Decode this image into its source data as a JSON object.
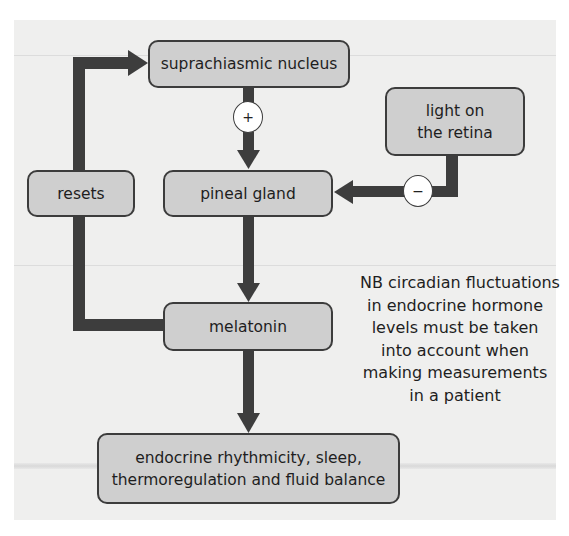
{
  "diagram": {
    "nodes": {
      "scn": {
        "label": "suprachiasmic nucleus"
      },
      "light": {
        "label_line1": "light on",
        "label_line2": "the retina"
      },
      "resets": {
        "label": "resets"
      },
      "pineal": {
        "label": "pineal gland"
      },
      "melatonin": {
        "label": "melatonin"
      },
      "effects": {
        "label_line1": "endocrine rhythmicity, sleep,",
        "label_line2": "thermoregulation and fluid balance"
      }
    },
    "edges": [
      {
        "from": "scn",
        "to": "pineal",
        "sign": "+"
      },
      {
        "from": "light",
        "to": "pineal",
        "sign": "−"
      },
      {
        "from": "pineal",
        "to": "melatonin",
        "sign": ""
      },
      {
        "from": "melatonin",
        "to": "effects",
        "sign": ""
      },
      {
        "from": "melatonin",
        "to": "resets",
        "sign": ""
      },
      {
        "from": "resets",
        "to": "scn",
        "sign": ""
      }
    ],
    "signs": {
      "plus": "+",
      "minus": "−"
    },
    "note": [
      "NB circadian fluctuations",
      "in endocrine hormone",
      "levels must be taken",
      "into account when",
      "making measurements",
      "in a patient"
    ],
    "colors": {
      "panel": "#efefee",
      "box_fill": "#cfcfcf",
      "box_border": "#3c3c3c",
      "arrow": "#3d3d3d",
      "sign_fill": "#ffffff"
    }
  }
}
